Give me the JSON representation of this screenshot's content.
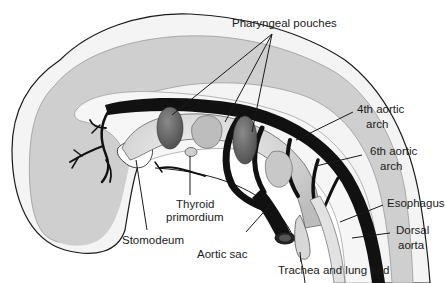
{
  "figure": {
    "colors": {
      "background": "#ffffff",
      "outline": "#1a1a1a",
      "tissue_light": "#f2f2f2",
      "tissue_gray": "#cfcfcf",
      "vessels": "#111111",
      "pouch_dark": "#6e6e6e",
      "pharynx_light": "#dedede"
    }
  },
  "labels": {
    "pharyngeal_pouches": "Pharyngeal pouches",
    "fourth_arch_1": "4th aortic",
    "fourth_arch_2": "arch",
    "sixth_arch_1": "6th aortic",
    "sixth_arch_2": "arch",
    "esophagus": "Esophagus",
    "dorsal_aorta_1": "Dorsal",
    "dorsal_aorta_2": "aorta",
    "trachea": "Trachea and lung bud",
    "aortic_sac": "Aortic sac",
    "stomodeum": "Stomodeum",
    "thyroid_1": "Thyroid",
    "thyroid_2": "primordium"
  }
}
